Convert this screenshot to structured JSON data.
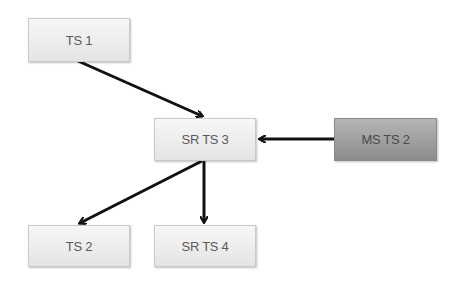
{
  "diagram": {
    "nodes": [
      {
        "id": "ts1",
        "label": "TS 1",
        "style": "light"
      },
      {
        "id": "srts3",
        "label": "SR TS 3",
        "style": "light"
      },
      {
        "id": "msts2",
        "label": "MS TS 2",
        "style": "dark"
      },
      {
        "id": "ts2",
        "label": "TS 2",
        "style": "light"
      },
      {
        "id": "srts4",
        "label": "SR TS 4",
        "style": "light"
      }
    ],
    "edges": [
      {
        "from": "TS 1",
        "to": "SR TS 3"
      },
      {
        "from": "MS TS 2",
        "to": "SR TS 3"
      },
      {
        "from": "SR TS 3",
        "to": "TS 2"
      },
      {
        "from": "SR TS 3",
        "to": "SR TS 4"
      }
    ],
    "colors": {
      "light_node": "#ececec",
      "dark_node": "#9e9e9e",
      "arrow": "#111111",
      "text": "#5a5a5a"
    }
  }
}
